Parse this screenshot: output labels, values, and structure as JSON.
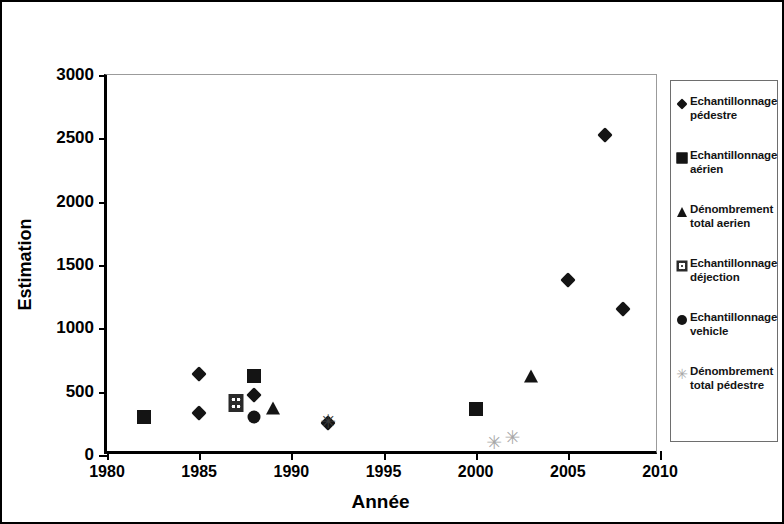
{
  "chart_data": {
    "type": "scatter",
    "title": "",
    "xlabel": "Année",
    "ylabel": "Estimation",
    "xlim": [
      1980,
      2010
    ],
    "ylim": [
      0,
      3000
    ],
    "xticks": [
      1980,
      1985,
      1990,
      1995,
      2000,
      2005,
      2010
    ],
    "yticks": [
      0,
      500,
      1000,
      1500,
      2000,
      2500,
      3000
    ],
    "grid": false,
    "legend_position": "right",
    "series": [
      {
        "name": "Echantillonnage pédestre",
        "marker": "diamond",
        "color": "#141414",
        "points": [
          {
            "x": 1985,
            "y": 640
          },
          {
            "x": 1985,
            "y": 330
          },
          {
            "x": 1988,
            "y": 475
          },
          {
            "x": 1992,
            "y": 250
          },
          {
            "x": 2005,
            "y": 1380
          },
          {
            "x": 2007,
            "y": 2530
          },
          {
            "x": 2008,
            "y": 1150
          }
        ]
      },
      {
        "name": "Echantillonnage aérien",
        "marker": "square",
        "color": "#141414",
        "points": [
          {
            "x": 1982,
            "y": 300
          },
          {
            "x": 1988,
            "y": 620
          },
          {
            "x": 2000,
            "y": 365
          }
        ]
      },
      {
        "name": "Dénombrement total aerien",
        "marker": "triangle",
        "color": "#141414",
        "points": [
          {
            "x": 1989,
            "y": 375
          },
          {
            "x": 2003,
            "y": 625
          }
        ]
      },
      {
        "name": "Echantillonnage déjection",
        "marker": "dotted-square",
        "color": "#2a2a2a",
        "points": [
          {
            "x": 1987,
            "y": 410
          }
        ]
      },
      {
        "name": "Echantillonnage vehicle",
        "marker": "circle",
        "color": "#141414",
        "points": [
          {
            "x": 1988,
            "y": 300
          }
        ]
      },
      {
        "name": "Dénombrement total pédestre",
        "marker": "asterisk",
        "color": "#a8a8a8",
        "points": [
          {
            "x": 1992,
            "y": 265,
            "shade": "dark"
          },
          {
            "x": 2001,
            "y": 105
          },
          {
            "x": 2002,
            "y": 140
          }
        ]
      }
    ]
  },
  "axes": {
    "y_title": "Estimation",
    "x_title": "Année",
    "y_tick_labels": [
      "3000",
      "2500",
      "2000",
      "1500",
      "1000",
      "500",
      "0"
    ],
    "x_tick_labels": [
      "1980",
      "1985",
      "1990",
      "1995",
      "2000",
      "2005",
      "2010"
    ]
  },
  "legend": {
    "items": [
      {
        "label_line1": "Echantillonnage",
        "label_line2": "pédestre",
        "marker": "diamond"
      },
      {
        "label_line1": "Echantillonnage",
        "label_line2": "aérien",
        "marker": "square"
      },
      {
        "label_line1": "Dénombrement",
        "label_line2": "total aerien",
        "marker": "triangle"
      },
      {
        "label_line1": "Echantillonnage",
        "label_line2": "déjection",
        "marker": "dotted-square"
      },
      {
        "label_line1": "Echantillonnage",
        "label_line2": "vehicle",
        "marker": "circle"
      },
      {
        "label_line1": "Dénombrement",
        "label_line2": "total pédestre",
        "marker": "asterisk"
      }
    ]
  }
}
